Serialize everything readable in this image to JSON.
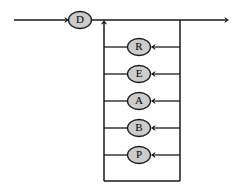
{
  "diagram": {
    "type": "flow-loop-diagram",
    "canvas": {
      "width": 239,
      "height": 195,
      "background": "#ffffff"
    },
    "colors": {
      "node_fill": "#cccccc",
      "node_stroke": "#1a1a1a",
      "line": "#1a1a1a",
      "label": "#000000"
    },
    "entry": {
      "name": "entry-arrow",
      "from_x": 14,
      "to_x": 69,
      "y": 20
    },
    "exit": {
      "name": "exit-arrow",
      "from_x": 180,
      "to_x": 229,
      "y": 20
    },
    "rails": {
      "left_x": 104,
      "right_x": 180,
      "top_y": 20,
      "bottom_y": 181
    },
    "head_node": {
      "label": "D",
      "cx": 80,
      "cy": 20,
      "rx": 11.5,
      "ry": 8.5
    },
    "loop_nodes": [
      {
        "label": "R",
        "cx": 139,
        "cy": 47,
        "rx": 11.5,
        "ry": 8.5
      },
      {
        "label": "E",
        "cx": 139,
        "cy": 74,
        "rx": 11.5,
        "ry": 8.5
      },
      {
        "label": "A",
        "cx": 139,
        "cy": 101,
        "rx": 11.5,
        "ry": 8.5
      },
      {
        "label": "B",
        "cx": 139,
        "cy": 128,
        "rx": 11.5,
        "ry": 8.5
      },
      {
        "label": "P",
        "cx": 139,
        "cy": 155,
        "rx": 11.5,
        "ry": 8.5
      }
    ]
  }
}
